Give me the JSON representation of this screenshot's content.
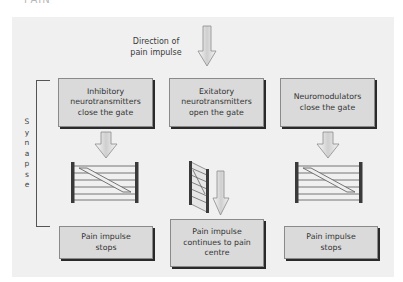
{
  "title_fragment": "PAIN",
  "direction_label": "Direction of\npain impulse",
  "synapse_label": [
    "S",
    "y",
    "n",
    "a",
    "p",
    "s",
    "e"
  ],
  "top_boxes": [
    {
      "id": "inhibitory",
      "text": "Inhibitory\nneurotransmitters\nclose the gate"
    },
    {
      "id": "exitatory",
      "text": "Exitatory\nneurotransmitters\nopen the gate"
    },
    {
      "id": "neuromodulators",
      "text": "Neuromodulators\nclose the gate"
    }
  ],
  "bottom_boxes": [
    {
      "id": "left",
      "text": "Pain impulse\nstops"
    },
    {
      "id": "center",
      "text": "Pain impulse\ncontinues to pain\ncentre"
    },
    {
      "id": "right",
      "text": "Pain impulse\nstops"
    }
  ],
  "gates": [
    {
      "id": "left",
      "state": "closed"
    },
    {
      "id": "center",
      "state": "open"
    },
    {
      "id": "right",
      "state": "closed"
    }
  ],
  "colors": {
    "panel": "#f0f0f0",
    "box": "#dadada",
    "shadow": "#2a2a2a",
    "arrow_fill": "#e8e8e8",
    "arrow_stroke": "#8a8a8a",
    "gate_post": "#3a3a3a"
  }
}
